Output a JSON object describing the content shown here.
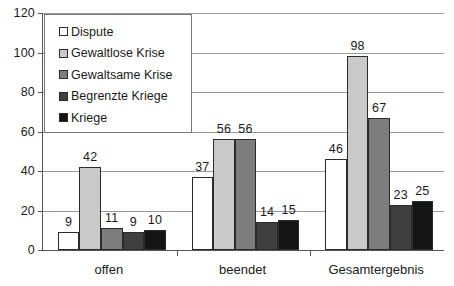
{
  "chart_data": {
    "type": "bar",
    "title": "",
    "xlabel": "",
    "ylabel": "",
    "categories": [
      "offen",
      "beendet",
      "Gesamtergebnis"
    ],
    "series": [
      {
        "name": "Dispute",
        "color": "#ffffff",
        "values": [
          9,
          37,
          46
        ]
      },
      {
        "name": "Gewaltlose Krise",
        "color": "#c9c9c9",
        "values": [
          42,
          56,
          98
        ]
      },
      {
        "name": "Gewaltsame Krise",
        "color": "#7d7d7d",
        "values": [
          11,
          56,
          67
        ]
      },
      {
        "name": "Begrenzte Kriege",
        "color": "#3f3f3f",
        "values": [
          9,
          14,
          23
        ]
      },
      {
        "name": "Kriege",
        "color": "#151515",
        "values": [
          10,
          15,
          25
        ]
      }
    ],
    "ylim": [
      0,
      120
    ],
    "y_ticks": [
      0,
      20,
      40,
      60,
      80,
      100,
      120
    ],
    "y_tick_labels": [
      "0",
      "20",
      "40",
      "60",
      "80",
      "100",
      "120"
    ],
    "grid": true,
    "legend_position": "top-left",
    "data_labels": true
  },
  "legend": {
    "entries": [
      "Dispute",
      "Gewaltlose Krise",
      "Gewaltsame Krise",
      "Begrenzte Kriege",
      "Kriege"
    ]
  },
  "axis": {
    "y_labels": [
      "120",
      "100",
      "80",
      "60",
      "40",
      "20",
      "0"
    ],
    "x_labels": [
      "offen",
      "beendet",
      "Gesamtergebnis"
    ]
  }
}
